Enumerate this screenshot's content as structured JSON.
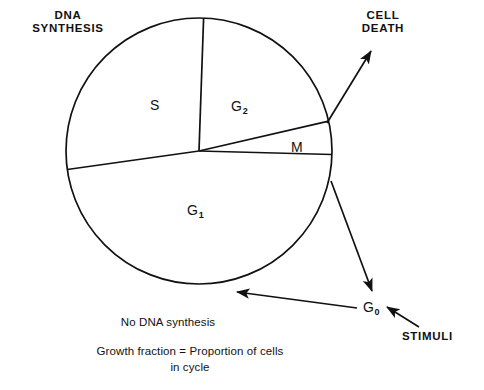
{
  "figure": {
    "type": "diagram",
    "background_color": "#ffffff",
    "stroke_color": "#111111"
  },
  "pie": {
    "center": {
      "x": 199,
      "y": 151
    },
    "radius": 133,
    "sectors": [
      {
        "key": "S",
        "label": "S",
        "subscript": "",
        "start_deg": 172.0,
        "end_deg": 268.0
      },
      {
        "key": "G2",
        "label": "G",
        "subscript": "2",
        "start_deg": 268.0,
        "end_deg": 347.0
      },
      {
        "key": "M",
        "label": "M",
        "subscript": "",
        "start_deg": 347.0,
        "end_deg": 1.5
      },
      {
        "key": "G1",
        "label": "G",
        "subscript": "1",
        "start_deg": 1.5,
        "end_deg": 172.0
      }
    ]
  },
  "labels": {
    "dna_synthesis": {
      "line1": "DNA",
      "line2": "SYNTHESIS"
    },
    "cell_death": {
      "line1": "CELL",
      "line2": "DEATH"
    },
    "stimuli": "STIMULI",
    "g0": {
      "text": "G",
      "subscript": "0"
    },
    "phase_s": {
      "text": "S",
      "subscript": ""
    },
    "phase_g2": {
      "text": "G",
      "subscript": "2"
    },
    "phase_m": {
      "text": "M",
      "subscript": ""
    },
    "phase_g1": {
      "text": "G",
      "subscript": "1"
    }
  },
  "captions": {
    "no_dna_synthesis": "No DNA synthesis",
    "growth_fraction": "Growth fraction = Proportion of cells",
    "in_cycle": "in cycle"
  },
  "arrows": [
    {
      "name": "cell-death-arrow",
      "from": {
        "x": 327,
        "y": 123
      },
      "to": {
        "x": 371,
        "y": 50
      }
    },
    {
      "name": "g0-exit-arrow",
      "from": {
        "x": 331,
        "y": 181
      },
      "to": {
        "x": 373,
        "y": 293
      }
    },
    {
      "name": "g0-reentry-arrow",
      "from": {
        "x": 356,
        "y": 307
      },
      "to": {
        "x": 236,
        "y": 292
      }
    },
    {
      "name": "stimuli-arrow",
      "from": {
        "x": 418,
        "y": 326
      },
      "to": {
        "x": 386,
        "y": 307
      }
    }
  ]
}
